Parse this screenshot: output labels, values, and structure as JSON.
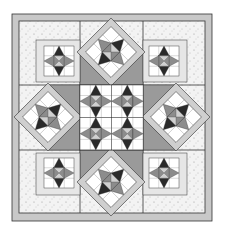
{
  "image": {
    "subject": "quilt-pattern-illustration",
    "description": "Sampler quilt with star blocks: four straight-set corner star blocks, four on-point star blocks, and a central nine-patch star medallion, framed by a gray border",
    "colors": {
      "background": "#ffffff",
      "border": "#c8c8c8",
      "speckled_fabric": "#f2f2f2",
      "light_gray": "#d0d0d0",
      "medium_gray": "#8c8c8c",
      "dark": "#2a2a2a",
      "outline": "#333333"
    },
    "layout": {
      "grid": "3x3",
      "corner_blocks": [
        "star-top-left",
        "star-top-right",
        "star-bottom-left",
        "star-bottom-right"
      ],
      "on_point_blocks": [
        "star-top",
        "star-left",
        "star-right",
        "star-bottom"
      ],
      "center_block": "star-medallion"
    }
  }
}
